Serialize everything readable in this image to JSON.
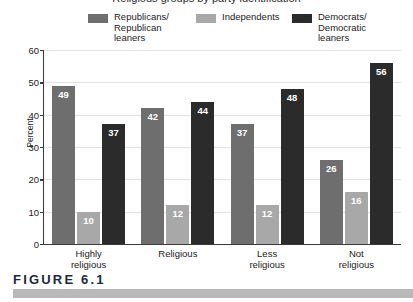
{
  "title_remnant": "Religious groups by party identification",
  "figure": {
    "caption": "FIGURE 6.1"
  },
  "legend": {
    "items": [
      {
        "label": "Republicans/\nRepublican\nleaners",
        "color": "#6e6e6e",
        "icon": "legend-swatch-icon"
      },
      {
        "label": "Independents",
        "color": "#a8a8a8",
        "icon": "legend-swatch-icon"
      },
      {
        "label": "Democrats/\nDemocratic\nleaners",
        "color": "#2b2b2b",
        "icon": "legend-swatch-icon"
      }
    ]
  },
  "chart_data": {
    "type": "bar",
    "title": "",
    "xlabel": "",
    "ylabel": "Percent",
    "ylim": [
      0,
      60
    ],
    "yticks": [
      0,
      10,
      20,
      30,
      40,
      50,
      60
    ],
    "ytick_labels": [
      "0",
      "10",
      "20",
      "30",
      "40",
      "50",
      "60"
    ],
    "grid": true,
    "legend_position": "top",
    "categories": [
      "Highly\nreligious",
      "Religious",
      "Less\nreligious",
      "Not\nreligious"
    ],
    "series": [
      {
        "name": "Republicans/Republican leaners",
        "color": "#6e6e6e",
        "values": [
          49,
          42,
          37,
          26
        ]
      },
      {
        "name": "Independents",
        "color": "#a8a8a8",
        "values": [
          10,
          12,
          12,
          16
        ]
      },
      {
        "name": "Democrats/Democratic leaners",
        "color": "#2b2b2b",
        "values": [
          37,
          44,
          48,
          56
        ]
      }
    ]
  }
}
